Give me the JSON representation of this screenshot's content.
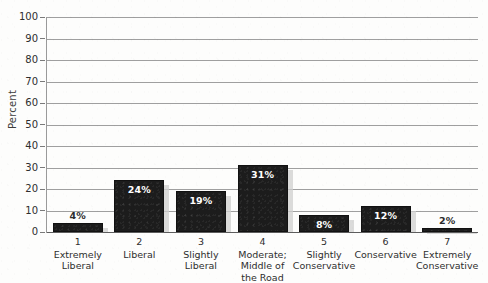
{
  "chart_data": {
    "type": "bar",
    "title": "",
    "xlabel": "",
    "ylabel": "Percent",
    "ylim": [
      0,
      100
    ],
    "grid": true,
    "legend": "none",
    "categories": [
      "Extremely Liberal",
      "Liberal",
      "Slightly Liberal",
      "Moderate; Middle of the Road",
      "Slightly Conservative",
      "Conservative",
      "Extremely Conservative"
    ],
    "category_numbers": [
      "1",
      "2",
      "3",
      "4",
      "5",
      "6",
      "7"
    ],
    "values": [
      4,
      24,
      19,
      31,
      8,
      12,
      2
    ],
    "data_labels": [
      "4%",
      "24%",
      "19%",
      "31%",
      "8%",
      "12%",
      "2%"
    ],
    "label_placement": [
      "outside",
      "inside",
      "inside",
      "inside",
      "inside",
      "inside",
      "outside"
    ],
    "ytick_labels": [
      "100",
      "90",
      "80",
      "70",
      "60",
      "50",
      "40",
      "30",
      "20",
      "10",
      "0"
    ],
    "ytick_values": [
      100,
      90,
      80,
      70,
      60,
      50,
      40,
      30,
      20,
      10,
      0
    ],
    "colors": {
      "bar": "#1c1c1c",
      "bar_shadow": "#cfcfcf",
      "gridline": "#8e8e8e",
      "axis": "#5d5d5d",
      "label_inside": "#ffffff",
      "label_outside": "#2b2b2b",
      "text": "#2e2e2e",
      "background": "#fdfdfc"
    }
  },
  "axis": {
    "y_title": "Percent"
  },
  "categories_multiline": [
    [
      "Extremely",
      "Liberal"
    ],
    [
      "Liberal"
    ],
    [
      "Slightly",
      "Liberal"
    ],
    [
      "Moderate;",
      "Middle of",
      "the Road"
    ],
    [
      "Slightly",
      "Conservative"
    ],
    [
      "Conservative"
    ],
    [
      "Extremely",
      "Conservative"
    ]
  ]
}
